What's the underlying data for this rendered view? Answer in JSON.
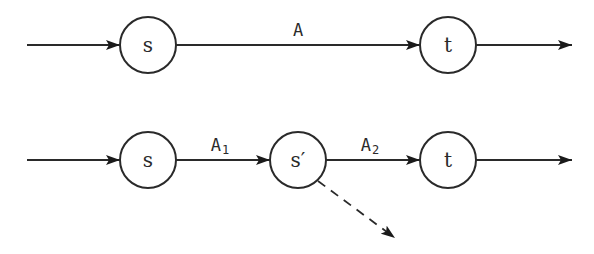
{
  "diagram": {
    "top_row": {
      "nodes": [
        {
          "id": "s",
          "label": "s",
          "cx": 148,
          "cy": 45
        },
        {
          "id": "t",
          "label": "t",
          "cx": 448,
          "cy": 45
        }
      ],
      "edges": [
        {
          "from": "input",
          "to": "s",
          "label": ""
        },
        {
          "from": "s",
          "to": "t",
          "label": "A"
        },
        {
          "from": "t",
          "to": "output",
          "label": ""
        }
      ]
    },
    "bottom_row": {
      "nodes": [
        {
          "id": "s",
          "label": "s",
          "cx": 148,
          "cy": 160
        },
        {
          "id": "s_prime",
          "label": "s′",
          "cx": 298,
          "cy": 160
        },
        {
          "id": "t",
          "label": "t",
          "cx": 448,
          "cy": 160
        }
      ],
      "edges": [
        {
          "from": "input",
          "to": "s",
          "label": ""
        },
        {
          "from": "s",
          "to": "s_prime",
          "label": "A",
          "subscript": "1"
        },
        {
          "from": "s_prime",
          "to": "t",
          "label": "A",
          "subscript": "2"
        },
        {
          "from": "t",
          "to": "output",
          "label": ""
        },
        {
          "from": "s_prime",
          "to": "external",
          "label": "",
          "style": "dashed"
        }
      ]
    },
    "colors": {
      "stroke": "#2a2a2a",
      "background": "#ffffff"
    }
  }
}
